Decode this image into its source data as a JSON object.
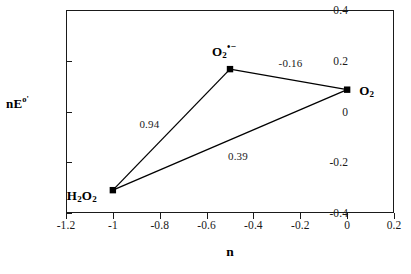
{
  "chart_data": {
    "type": "scatter",
    "title": "",
    "subtitle": "",
    "xlabel": "n",
    "ylabel": "nE°'",
    "ylabel_base": "nE",
    "ylabel_sup": "o'",
    "xlim": [
      -1.2,
      0.2
    ],
    "ylim": [
      -0.4,
      0.4
    ],
    "grid": false,
    "legend": "none",
    "xticks": [
      "-1.2",
      "-1",
      "-0.8",
      "-0.6",
      "-0.4",
      "-0.2",
      "0",
      "0.2"
    ],
    "xtick_values": [
      -1.2,
      -1,
      -0.8,
      -0.6,
      -0.4,
      -0.2,
      0,
      0.2
    ],
    "yticks": [
      "0.4",
      "0.2",
      "0",
      "-0.2",
      "-0.4"
    ],
    "ytick_values": [
      0.4,
      0.2,
      0,
      -0.2,
      -0.4
    ],
    "marker": "square",
    "marker_color": "#000000",
    "line_color": "#000000",
    "points": [
      {
        "id": "h2o2",
        "label": "H2O2",
        "x": -1.0,
        "y": -0.31
      },
      {
        "id": "superoxide",
        "label": "O2•−",
        "x": -0.5,
        "y": 0.167
      },
      {
        "id": "o2",
        "label": "O2",
        "x": 0.0,
        "y": 0.086
      }
    ],
    "edges": [
      {
        "from": "h2o2",
        "to": "superoxide",
        "value": "0.94",
        "value_num": 0.94
      },
      {
        "from": "superoxide",
        "to": "o2",
        "value": "-0.16",
        "value_num": -0.16
      },
      {
        "from": "h2o2",
        "to": "o2",
        "value": "0.39",
        "value_num": 0.39
      }
    ]
  },
  "species_labels": [
    {
      "name": "h2o2-label",
      "base": "H",
      "sub1": "2",
      "mid": "O",
      "sub2": "2",
      "sup": ""
    },
    {
      "name": "superoxide-label",
      "base": "O",
      "sub1": "2",
      "mid": "",
      "sub2": "",
      "sup": "•−"
    },
    {
      "name": "o2-label",
      "base": "O",
      "sub1": "2",
      "mid": "",
      "sub2": "",
      "sup": ""
    }
  ],
  "axis": {
    "x_title": "n",
    "y_title_base": "nE",
    "y_title_sup": "o'"
  },
  "edge_values": {
    "h2o2_to_superoxide": "0.94",
    "superoxide_to_o2": "-0.16",
    "h2o2_to_o2": "0.39"
  }
}
